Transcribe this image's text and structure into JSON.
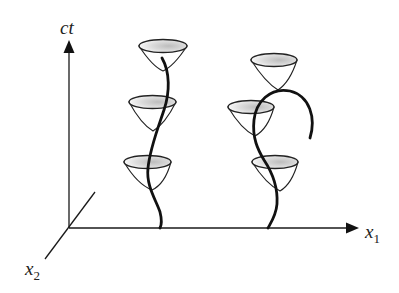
{
  "diagram": {
    "axes": {
      "vertical_label": "ct",
      "horizontal_label_base": "x",
      "horizontal_label_sub": "1",
      "depth_label_base": "x",
      "depth_label_sub": "2"
    },
    "worldlines": [
      {
        "name": "left-worldline",
        "cone_count": 3
      },
      {
        "name": "right-worldline",
        "cone_count": 3,
        "ends_with_arc": true
      }
    ],
    "colors": {
      "ink": "#111111",
      "rim_shade": "#c8c8c8"
    }
  }
}
